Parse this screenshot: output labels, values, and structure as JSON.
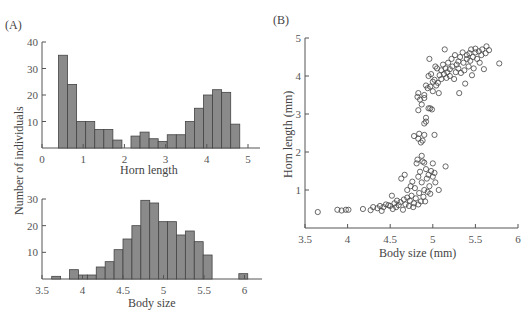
{
  "panels": {
    "A": {
      "label": "(A)"
    },
    "B": {
      "label": "(B)"
    }
  },
  "colors": {
    "bar_fill": "#8a8a8a",
    "bar_stroke": "#444444",
    "axis": "#555555",
    "marker_stroke": "#444444"
  },
  "chart_data": [
    {
      "id": "A-top",
      "type": "bar",
      "title": "",
      "xlabel": "Horn length",
      "ylabel": "Number of individuals",
      "xlim": [
        0,
        5.3
      ],
      "ylim": [
        0,
        40
      ],
      "xticks": [
        "0",
        "1",
        "2",
        "3",
        "4",
        "5"
      ],
      "yticks": [
        "10",
        "20",
        "30",
        "40"
      ],
      "bin_width": 0.22,
      "bins_start": [
        0.4,
        0.62,
        0.84,
        1.06,
        1.28,
        1.5,
        1.72,
        2.16,
        2.38,
        2.6,
        2.82,
        3.04,
        3.26,
        3.48,
        3.7,
        3.92,
        4.14,
        4.36,
        4.58
      ],
      "values": [
        35,
        24,
        10,
        10,
        7,
        7,
        3,
        4.5,
        6,
        3.5,
        2.5,
        5,
        5,
        10,
        15,
        20,
        22,
        21,
        9
      ],
      "grid": false
    },
    {
      "id": "A-bottom",
      "type": "bar",
      "title": "",
      "xlabel": "Body size",
      "ylabel": "Number of individuals",
      "xlim": [
        3.5,
        6.2
      ],
      "ylim": [
        0,
        30
      ],
      "xticks": [
        "3.5",
        "4",
        "4.5",
        "5",
        "5.5",
        "6"
      ],
      "yticks": [
        "10",
        "20",
        "30"
      ],
      "bin_width": 0.11,
      "bins_start": [
        3.62,
        3.84,
        3.95,
        4.06,
        4.17,
        4.28,
        4.39,
        4.5,
        4.61,
        4.72,
        4.83,
        4.94,
        5.05,
        5.16,
        5.27,
        5.38,
        5.49,
        5.6,
        5.93
      ],
      "values": [
        1,
        3.5,
        1.5,
        1.5,
        4.5,
        6.5,
        11,
        15,
        20,
        29.5,
        28.5,
        21.5,
        21.5,
        16.5,
        18,
        14,
        9,
        0,
        2
      ],
      "grid": false
    },
    {
      "id": "B",
      "type": "scatter",
      "title": "",
      "xlabel": "Body size (mm)",
      "ylabel": "Horn length (mm)",
      "xlim": [
        3.5,
        6
      ],
      "ylim": [
        0,
        5
      ],
      "xticks": [
        "3.5",
        "4",
        "4.5",
        "5",
        "5.5",
        "6"
      ],
      "yticks": [
        "1",
        "2",
        "3",
        "4",
        "5"
      ],
      "marker": "open-circle",
      "points": [
        [
          3.65,
          0.42
        ],
        [
          3.88,
          0.48
        ],
        [
          3.93,
          0.46
        ],
        [
          3.98,
          0.48
        ],
        [
          4.01,
          0.48
        ],
        [
          4.18,
          0.5
        ],
        [
          4.27,
          0.47
        ],
        [
          4.3,
          0.55
        ],
        [
          4.35,
          0.52
        ],
        [
          4.38,
          0.58
        ],
        [
          4.4,
          0.45
        ],
        [
          4.42,
          0.55
        ],
        [
          4.45,
          0.62
        ],
        [
          4.48,
          0.6
        ],
        [
          4.5,
          0.58
        ],
        [
          4.52,
          0.85
        ],
        [
          4.53,
          0.5
        ],
        [
          4.55,
          0.65
        ],
        [
          4.57,
          0.55
        ],
        [
          4.58,
          0.72
        ],
        [
          4.6,
          0.6
        ],
        [
          4.62,
          0.68
        ],
        [
          4.63,
          1.3
        ],
        [
          4.65,
          0.48
        ],
        [
          4.66,
          0.75
        ],
        [
          4.67,
          1.4
        ],
        [
          4.68,
          0.62
        ],
        [
          4.7,
          0.8
        ],
        [
          4.7,
          1.0
        ],
        [
          4.72,
          0.58
        ],
        [
          4.73,
          0.72
        ],
        [
          4.74,
          1.1
        ],
        [
          4.75,
          0.85
        ],
        [
          4.76,
          1.22
        ],
        [
          4.77,
          0.55
        ],
        [
          4.78,
          0.65
        ],
        [
          4.79,
          1.05
        ],
        [
          4.8,
          0.78
        ],
        [
          4.81,
          1.7
        ],
        [
          4.82,
          1.8
        ],
        [
          4.83,
          0.62
        ],
        [
          4.83,
          1.35
        ],
        [
          4.84,
          0.92
        ],
        [
          4.85,
          1.48
        ],
        [
          4.86,
          0.7
        ],
        [
          4.87,
          1.9
        ],
        [
          4.87,
          1.2
        ],
        [
          4.88,
          1.75
        ],
        [
          4.89,
          0.82
        ],
        [
          4.9,
          1.72
        ],
        [
          4.9,
          1.0
        ],
        [
          4.91,
          0.7
        ],
        [
          4.92,
          1.55
        ],
        [
          4.93,
          1.3
        ],
        [
          4.94,
          0.95
        ],
        [
          4.95,
          1.4
        ],
        [
          4.96,
          1.1
        ],
        [
          4.97,
          0.9
        ],
        [
          4.98,
          1.5
        ],
        [
          5.0,
          1.7
        ],
        [
          5.0,
          1.35
        ],
        [
          5.02,
          1.45
        ],
        [
          5.03,
          1.2
        ],
        [
          5.07,
          1.0
        ],
        [
          5.15,
          1.62
        ],
        [
          4.78,
          2.42
        ],
        [
          4.83,
          2.35
        ],
        [
          4.84,
          2.48
        ],
        [
          4.86,
          2.25
        ],
        [
          4.88,
          2.3
        ],
        [
          4.9,
          2.45
        ],
        [
          4.9,
          2.75
        ],
        [
          4.92,
          2.8
        ],
        [
          4.92,
          2.9
        ],
        [
          4.95,
          3.15
        ],
        [
          4.97,
          3.15
        ],
        [
          4.99,
          3.12
        ],
        [
          5.02,
          2.45
        ],
        [
          4.83,
          3.1
        ],
        [
          4.82,
          3.45
        ],
        [
          4.83,
          3.55
        ],
        [
          4.85,
          3.38
        ],
        [
          4.87,
          3.25
        ],
        [
          4.9,
          3.5
        ],
        [
          4.9,
          3.42
        ],
        [
          4.92,
          3.75
        ],
        [
          4.94,
          3.68
        ],
        [
          4.95,
          4.0
        ],
        [
          4.96,
          4.45
        ],
        [
          4.97,
          3.72
        ],
        [
          4.98,
          4.05
        ],
        [
          5.0,
          3.85
        ],
        [
          5.0,
          3.6
        ],
        [
          5.02,
          3.9
        ],
        [
          5.03,
          4.25
        ],
        [
          5.04,
          3.75
        ],
        [
          5.05,
          4.2
        ],
        [
          5.06,
          3.82
        ],
        [
          5.07,
          3.55
        ],
        [
          5.08,
          4.02
        ],
        [
          5.1,
          3.92
        ],
        [
          5.1,
          4.15
        ],
        [
          5.12,
          4.3
        ],
        [
          5.13,
          4.05
        ],
        [
          5.14,
          4.7
        ],
        [
          5.15,
          4.2
        ],
        [
          5.16,
          3.95
        ],
        [
          5.17,
          4.1
        ],
        [
          5.18,
          4.35
        ],
        [
          5.2,
          4.18
        ],
        [
          5.2,
          4.0
        ],
        [
          5.22,
          4.45
        ],
        [
          5.23,
          4.25
        ],
        [
          5.25,
          3.92
        ],
        [
          5.26,
          4.55
        ],
        [
          5.27,
          4.1
        ],
        [
          5.28,
          4.3
        ],
        [
          5.3,
          4.38
        ],
        [
          5.3,
          4.2
        ],
        [
          5.31,
          3.55
        ],
        [
          5.32,
          4.5
        ],
        [
          5.33,
          4.08
        ],
        [
          5.35,
          4.62
        ],
        [
          5.36,
          4.35
        ],
        [
          5.37,
          4.15
        ],
        [
          5.38,
          3.8
        ],
        [
          5.4,
          4.45
        ],
        [
          5.4,
          4.55
        ],
        [
          5.42,
          4.25
        ],
        [
          5.43,
          4.6
        ],
        [
          5.44,
          4.4
        ],
        [
          5.45,
          4.7
        ],
        [
          5.46,
          4.02
        ],
        [
          5.47,
          4.5
        ],
        [
          5.48,
          4.2
        ],
        [
          5.5,
          4.72
        ],
        [
          5.5,
          4.62
        ],
        [
          5.52,
          4.45
        ],
        [
          5.54,
          4.65
        ],
        [
          5.55,
          4.35
        ],
        [
          5.57,
          4.55
        ],
        [
          5.58,
          4.7
        ],
        [
          5.6,
          4.18
        ],
        [
          5.62,
          4.6
        ],
        [
          5.63,
          4.78
        ],
        [
          5.66,
          4.68
        ],
        [
          5.78,
          4.33
        ]
      ],
      "grid": false
    }
  ]
}
